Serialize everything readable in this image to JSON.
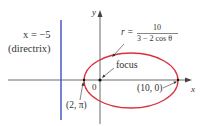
{
  "diagram": {
    "directrix_equation": "x = −5",
    "directrix_label": "(directrix)",
    "equation": {
      "lhs": "r =",
      "numerator": "10",
      "denominator": "3 − 2 cos θ"
    },
    "focus_label": "focus",
    "origin_label": "0",
    "x_axis_label": "x",
    "y_axis_label": "y",
    "point_left": "(2, π)",
    "point_right": "(10, 0)",
    "colors": {
      "ellipse": "#d9303a",
      "directrix": "#3a4fc4",
      "axes": "#333333"
    }
  }
}
